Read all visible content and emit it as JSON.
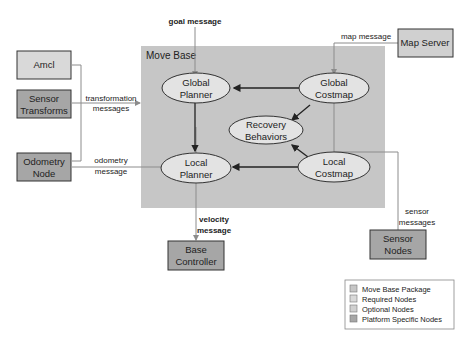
{
  "colors": {
    "move_base_package": "#c6c6c6",
    "required_nodes": "#d9d9d9",
    "optional_nodes": "#bfbfbf",
    "platform_specific": "#a6a6a6",
    "ellipse_fill": "#e3e3e3",
    "stroke": "#333333",
    "line": "#8c8c8c"
  },
  "container": {
    "label": "Move Base"
  },
  "nodes": {
    "amcl": "Amcl",
    "sensor_transforms": [
      "Sensor",
      "Transforms"
    ],
    "odometry_node": [
      "Odometry",
      "Node"
    ],
    "map_server": "Map Server",
    "base_controller": [
      "Base",
      "Controller"
    ],
    "sensor_nodes": [
      "Sensor",
      "Nodes"
    ],
    "global_planner": [
      "Global",
      "Planner"
    ],
    "local_planner": [
      "Local",
      "Planner"
    ],
    "global_costmap": [
      "Global",
      "Costmap"
    ],
    "local_costmap": [
      "Local",
      "Costmap"
    ],
    "recovery_behaviors": [
      "Recovery",
      "Behaviors"
    ]
  },
  "messages": {
    "goal": "goal message",
    "map": "map message",
    "transformation": [
      "transformation",
      "messages"
    ],
    "odometry": [
      "odometry",
      "message"
    ],
    "velocity": [
      "velocity",
      "message"
    ],
    "sensor": [
      "sensor",
      "messages"
    ]
  },
  "legend": [
    {
      "label": "Move Base Package",
      "color": "#c6c6c6"
    },
    {
      "label": "Required Nodes",
      "color": "#d9d9d9"
    },
    {
      "label": "Optional Nodes",
      "color": "#d0d0d0"
    },
    {
      "label": "Platform Specific Nodes",
      "color": "#a6a6a6"
    }
  ]
}
